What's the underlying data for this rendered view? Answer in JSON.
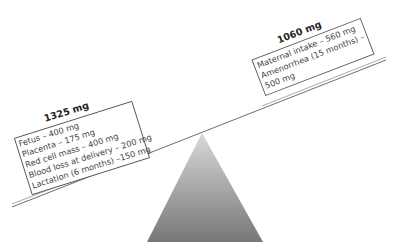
{
  "diagram": {
    "type": "balance-scale",
    "colors": {
      "fulcrum_top": "#d4d4d4",
      "fulcrum_bottom": "#7a7a7a",
      "beam": "#6e6e6e",
      "box_border": "#555555",
      "text": "#444444"
    },
    "left": {
      "total": "1325 mg",
      "items": [
        "Fetus – 400 mg",
        "Placenta – 175 mg",
        "Red cell mass – 400 mg",
        "Blood loss at delivery – 200 mg",
        "Lactation (6 months) –150 mg"
      ]
    },
    "right": {
      "total": "1060 mg",
      "items": [
        "Maternal intake – 560 mg",
        "Amenorrhea (15 months) –",
        "500 mg"
      ]
    }
  }
}
